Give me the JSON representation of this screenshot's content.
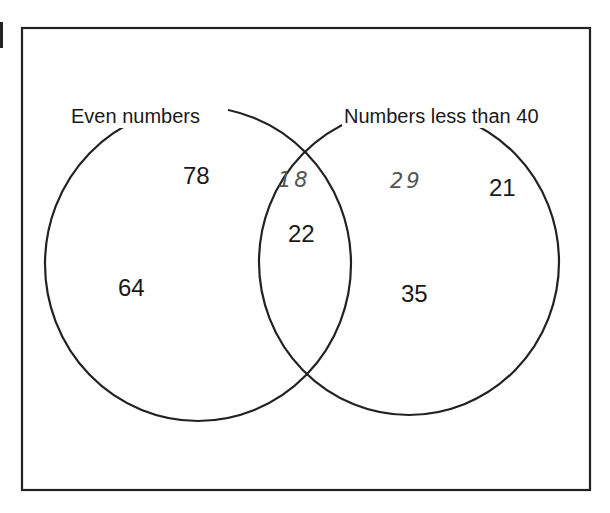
{
  "diagram": {
    "type": "venn",
    "sets": [
      {
        "label": "Even numbers"
      },
      {
        "label": "Numbers less than 40"
      }
    ],
    "regions": {
      "even_only": [
        "78",
        "64"
      ],
      "intersection_printed": [
        "22"
      ],
      "intersection_handwritten": [
        "18"
      ],
      "less_than_40_only_printed": [
        "21",
        "35"
      ],
      "less_than_40_only_handwritten": [
        "29"
      ]
    },
    "colors": {
      "line": "#222222",
      "text": "#1a1a1a",
      "handwriting": "#555555"
    }
  }
}
